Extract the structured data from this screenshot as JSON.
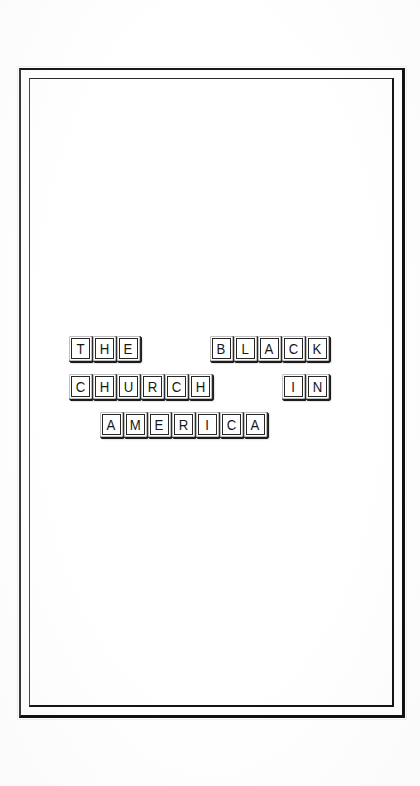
{
  "page": {
    "background_color": "#ffffff",
    "width": 420,
    "height": 786
  },
  "frame": {
    "name": "decorative-double-rule-border",
    "style": "double-line",
    "line_color": "#151515",
    "fill_color": "#ffffff"
  },
  "title": {
    "full_text": "THE BLACK CHURCH IN AMERICA",
    "rendered_as": "individual keycap tiles, one letter per tile",
    "tile_style": {
      "face_color": "#ffffff",
      "border_color": "#262626",
      "shadow_color": "#1c1c1c",
      "glyph_color": "#171717"
    },
    "rows": [
      {
        "row_index": 1,
        "words": [
          {
            "text": "THE",
            "letters": [
              "T",
              "H",
              "E"
            ]
          },
          {
            "text": "BLACK",
            "letters": [
              "B",
              "L",
              "A",
              "C",
              "K"
            ]
          }
        ]
      },
      {
        "row_index": 2,
        "words": [
          {
            "text": "CHURCH",
            "letters": [
              "C",
              "H",
              "U",
              "R",
              "C",
              "H"
            ]
          },
          {
            "text": "IN",
            "letters": [
              "I",
              "N"
            ]
          }
        ]
      },
      {
        "row_index": 3,
        "words": [
          {
            "text": "AMERICA",
            "letters": [
              "A",
              "M",
              "E",
              "R",
              "I",
              "C",
              "A"
            ]
          }
        ]
      }
    ]
  }
}
